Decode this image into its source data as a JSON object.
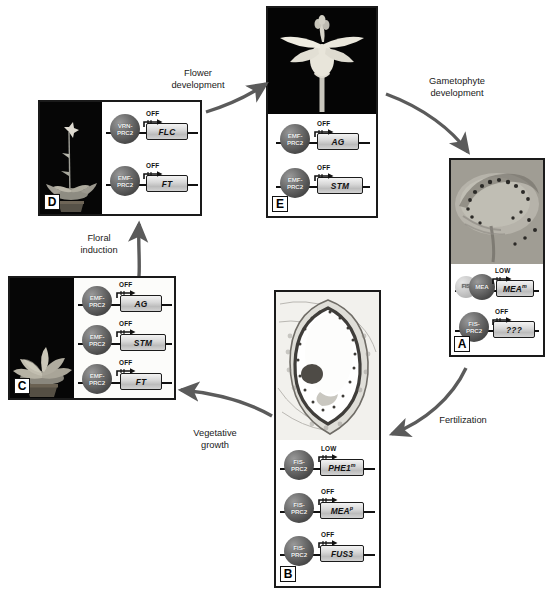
{
  "figure": {
    "type": "cycle-diagram"
  },
  "cycle_labels": [
    {
      "id": "flower-development",
      "text": "Flower\ndevelopment"
    },
    {
      "id": "gametophyte-development",
      "text": "Gametophyte\ndevelopment"
    },
    {
      "id": "fertilization",
      "text": "Fertilization"
    },
    {
      "id": "vegetative-growth",
      "text": "Vegetative\ngrowth"
    },
    {
      "id": "floral-induction",
      "text": "Floral\ninduction"
    }
  ],
  "panels": [
    {
      "id": "A",
      "letter": "A",
      "photo": "female-gametophyte-micrograph",
      "rows": [
        {
          "complexes": [
            {
              "label": "FIS",
              "style": "pale"
            },
            {
              "label": "MEA",
              "style": "dark"
            }
          ],
          "state": "LOW",
          "gene": "MEA",
          "gene_sup": "m"
        },
        {
          "complexes": [
            {
              "label": "FIS-\nPRC2",
              "style": "dark"
            }
          ],
          "state": "OFF",
          "gene": "???",
          "gene_sup": ""
        }
      ]
    },
    {
      "id": "B",
      "letter": "B",
      "photo": "developing-seed-section",
      "rows": [
        {
          "complexes": [
            {
              "label": "FIS-\nPRC2",
              "style": "dark"
            }
          ],
          "state": "LOW",
          "gene": "PHE1",
          "gene_sup": "m"
        },
        {
          "complexes": [
            {
              "label": "FIS-\nPRC2",
              "style": "dark"
            }
          ],
          "state": "OFF",
          "gene": "MEA",
          "gene_sup": "p"
        },
        {
          "complexes": [
            {
              "label": "FIS-\nPRC2",
              "style": "dark"
            }
          ],
          "state": "OFF",
          "gene": "FUS3",
          "gene_sup": ""
        }
      ]
    },
    {
      "id": "C",
      "letter": "C",
      "photo": "arabidopsis-rosette-seedling",
      "rows": [
        {
          "complexes": [
            {
              "label": "EMF-\nPRC2",
              "style": "dark"
            }
          ],
          "state": "OFF",
          "gene": "AG",
          "gene_sup": ""
        },
        {
          "complexes": [
            {
              "label": "EMF-\nPRC2",
              "style": "dark"
            }
          ],
          "state": "OFF",
          "gene": "STM",
          "gene_sup": ""
        },
        {
          "complexes": [
            {
              "label": "EMF-\nPRC2",
              "style": "dark"
            }
          ],
          "state": "OFF",
          "gene": "FT",
          "gene_sup": ""
        }
      ]
    },
    {
      "id": "D",
      "letter": "D",
      "photo": "bolting-flowering-plant",
      "rows": [
        {
          "complexes": [
            {
              "label": "VRN-\nPRC2",
              "style": "dark"
            }
          ],
          "state": "OFF",
          "gene": "FLC",
          "gene_sup": ""
        },
        {
          "complexes": [
            {
              "label": "EMF-\nPRC2",
              "style": "dark"
            }
          ],
          "state": "OFF",
          "gene": "FT",
          "gene_sup": ""
        }
      ]
    },
    {
      "id": "E",
      "letter": "E",
      "photo": "arabidopsis-flower-closeup",
      "rows": [
        {
          "complexes": [
            {
              "label": "EMF-\nPRC2",
              "style": "dark"
            }
          ],
          "state": "OFF",
          "gene": "AG",
          "gene_sup": ""
        },
        {
          "complexes": [
            {
              "label": "EMF-\nPRC2",
              "style": "dark"
            }
          ],
          "state": "OFF",
          "gene": "STM",
          "gene_sup": ""
        }
      ]
    }
  ],
  "colors": {
    "ink": "#1a1a1a",
    "arrow": "#555555",
    "complex_dark": "#555555",
    "complex_pale": "#c8c8c8",
    "gene_box": "#d4d4d4"
  }
}
